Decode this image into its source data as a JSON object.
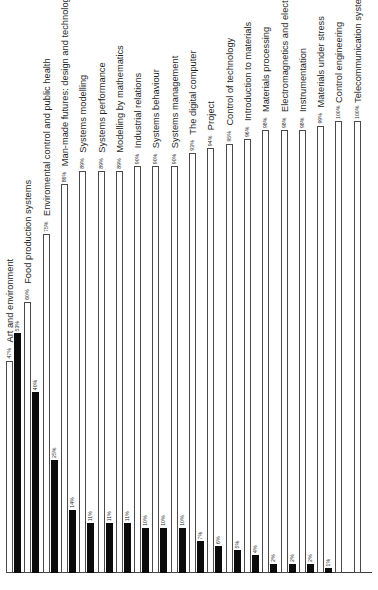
{
  "chart_data": {
    "type": "bar",
    "title": "",
    "subtitle": "",
    "xlabel": "",
    "ylabel": "",
    "orientation": "horizontal-rotated",
    "grid": false,
    "legend_position": "none",
    "value_suffix": "%",
    "xlim": [
      0,
      100
    ],
    "axis_line": true,
    "categories": [
      "Art and environment",
      "Food production systems",
      "Enviromental control and public health",
      "Man-made futures: design and technology",
      "Systems modelling",
      "Systems performance",
      "Modelling by mathematics",
      "Industrial relations",
      "Systems behaviour",
      "Systems management",
      "The digital computer",
      "Project",
      "Control of technology",
      "Introduction to materials",
      "Materials processing",
      "Electromagnetics and electronics",
      "Instrumentation",
      "Materials under stress",
      "Control engineering",
      "Telecommunication systems"
    ],
    "series": [
      {
        "name": "white",
        "style": "outlined-white",
        "color": "#ffffff",
        "border_color": "#4a4a4a",
        "values": [
          47,
          60,
          75,
          86,
          89,
          89,
          89,
          90,
          90,
          90,
          93,
          94,
          95,
          96,
          98,
          98,
          98,
          99,
          100,
          100
        ],
        "labels": [
          "47%",
          "60%",
          "75%",
          "86%",
          "89%",
          "89%",
          "89%",
          "90%",
          "90%",
          "90%",
          "93%",
          "94%",
          "95%",
          "96%",
          "98%",
          "98%",
          "98%",
          "99%",
          "100%",
          "100%"
        ]
      },
      {
        "name": "black",
        "style": "solid-black",
        "color": "#0b0b0b",
        "border_color": "#0b0b0b",
        "values": [
          53,
          40,
          25,
          14,
          11,
          11,
          11,
          10,
          10,
          10,
          7,
          6,
          5,
          4,
          2,
          2,
          2,
          1,
          0,
          0
        ],
        "labels": [
          "53%",
          "40%",
          "25%",
          "14%",
          "11%",
          "11%",
          "11%",
          "10%",
          "10%",
          "10%",
          "7%",
          "6%",
          "5%",
          "4%",
          "2%",
          "2%",
          "2%",
          "1%",
          "",
          ""
        ]
      }
    ]
  }
}
